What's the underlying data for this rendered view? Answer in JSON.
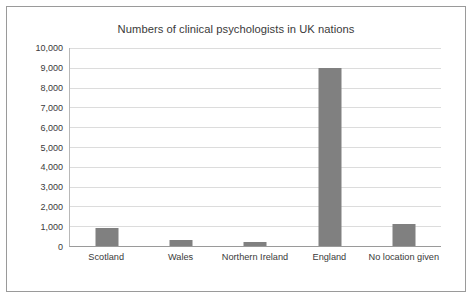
{
  "chart_data": {
    "type": "bar",
    "title": "Numbers of clinical psychologists in UK nations",
    "xlabel": "",
    "ylabel": "",
    "categories": [
      "Scotland",
      "Wales",
      "Northern Ireland",
      "England",
      "No location given"
    ],
    "values": [
      900,
      280,
      180,
      9000,
      1100
    ],
    "ytick_labels": [
      "0",
      "1,000",
      "2,000",
      "3,000",
      "4,000",
      "5,000",
      "6,000",
      "7,000",
      "8,000",
      "9,000",
      "10,000"
    ],
    "ytick_values": [
      0,
      1000,
      2000,
      3000,
      4000,
      5000,
      6000,
      7000,
      8000,
      9000,
      10000
    ],
    "ylim": [
      0,
      10000
    ],
    "grid": true,
    "legend": false,
    "bar_color": "#808080",
    "gridline_color": "#dcdcdc",
    "axis_color": "#9a9a9a",
    "border_color": "#9a9a9a",
    "text_color": "#3a3a3a"
  }
}
